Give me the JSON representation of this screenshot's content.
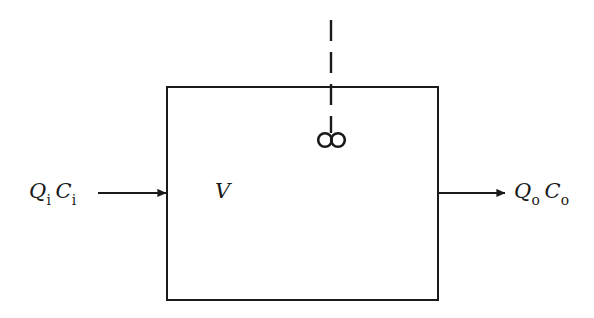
{
  "figure": {
    "type": "diagram",
    "background_color": "#ffffff",
    "stroke_color": "#1a1a1a",
    "canvas": {
      "width": 594,
      "height": 318
    }
  },
  "reactor": {
    "name": "reactor-vessel",
    "shape": "rectangle",
    "x": 167,
    "y": 87,
    "width": 271,
    "height": 213,
    "stroke_width": 2,
    "fill": "none",
    "volume_label": {
      "symbol": "V",
      "meaning": "reactor volume"
    }
  },
  "mixer": {
    "name": "mixer-assembly",
    "shaft": {
      "style": "dashed",
      "x": 331,
      "y_top": 20,
      "y_bottom": 133,
      "dash_pattern": "20 10"
    },
    "impeller": {
      "style": "two-circles",
      "circle_radius": 7,
      "left_center_x": 325,
      "right_center_x": 338,
      "center_y": 140,
      "stroke_width": 2.5
    }
  },
  "flows": {
    "inlet": {
      "name": "inlet-flow",
      "label_q": "Q",
      "label_q_sub": "i",
      "label_c": "C",
      "label_c_sub": "i",
      "full_label": "Qi Ci",
      "meaning": "influent flow rate and influent concentration",
      "arrow": {
        "x_start": 98,
        "x_end": 167,
        "y": 193
      }
    },
    "outlet": {
      "name": "outlet-flow",
      "label_q": "Q",
      "label_q_sub": "o",
      "label_c": "C",
      "label_c_sub": "o",
      "full_label": "Qo Co",
      "meaning": "effluent flow rate and effluent concentration",
      "arrow": {
        "x_start": 438,
        "x_end": 506,
        "y": 193
      }
    }
  }
}
